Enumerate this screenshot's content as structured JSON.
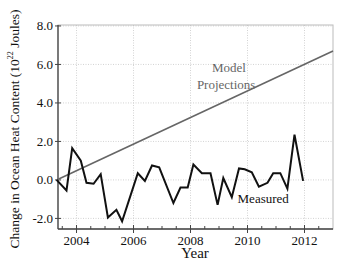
{
  "chart_data": {
    "type": "line",
    "title": "",
    "xlabel": "Year",
    "ylabel": "Change in Ocean Heat Content (10²² Joules)",
    "ylabel_parts": {
      "main": "Change in Ocean Heat Content (10",
      "sup": "22",
      "tail": " Joules)"
    },
    "xlim": [
      2003.35,
      2013.0
    ],
    "ylim": [
      -2.55,
      8.05
    ],
    "x_ticks": [
      2004,
      2006,
      2008,
      2010,
      2012
    ],
    "x_tick_labels": [
      "2004",
      "2006",
      "2008",
      "2010",
      "2012"
    ],
    "y_ticks": [
      -2.0,
      0.0,
      2.0,
      4.0,
      6.0,
      8.0
    ],
    "y_tick_labels": [
      "-2.0",
      "0.0",
      "2.0",
      "4.0",
      "6.0",
      "8.0"
    ],
    "grid": true,
    "legend": "none (inline annotations)",
    "series": [
      {
        "name": "Measured",
        "color": "#111111",
        "x": [
          2003.3,
          2003.65,
          2003.85,
          2004.15,
          2004.35,
          2004.6,
          2004.85,
          2005.1,
          2005.4,
          2005.6,
          2006.15,
          2006.4,
          2006.65,
          2006.9,
          2007.4,
          2007.65,
          2007.9,
          2008.1,
          2008.4,
          2008.7,
          2008.95,
          2009.15,
          2009.45,
          2009.7,
          2009.9,
          2010.15,
          2010.4,
          2010.7,
          2010.9,
          2011.15,
          2011.4,
          2011.65,
          2011.95
        ],
        "values": [
          0.0,
          -0.55,
          1.65,
          1.0,
          -0.15,
          -0.2,
          0.3,
          -1.95,
          -1.55,
          -2.15,
          0.35,
          -0.05,
          0.75,
          0.65,
          -1.2,
          -0.4,
          -0.4,
          0.8,
          0.35,
          0.35,
          -1.3,
          0.1,
          -0.9,
          0.6,
          0.55,
          0.4,
          -0.35,
          -0.15,
          0.35,
          0.35,
          -0.45,
          2.35,
          -0.05
        ]
      },
      {
        "name": "Model Projections",
        "color": "#666666",
        "x": [
          2003.3,
          2013.0
        ],
        "values": [
          0.0,
          6.7
        ]
      }
    ],
    "annotations": [
      {
        "text": "Model",
        "x": 2009.35,
        "y": 5.6
      },
      {
        "text": "Projections",
        "x": 2009.25,
        "y": 4.75
      },
      {
        "text": "Measured",
        "x": 2010.55,
        "y": -1.2
      }
    ]
  }
}
